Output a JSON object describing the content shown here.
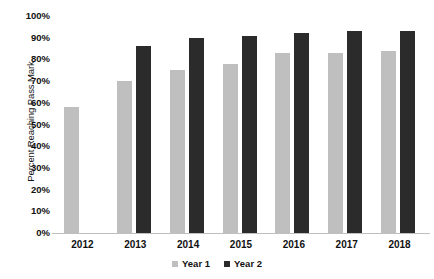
{
  "chart_data": {
    "type": "bar",
    "title": "",
    "xlabel": "",
    "ylabel": "Percent Reaching Pass Mark",
    "ylim": [
      0,
      100
    ],
    "ytick_labels": [
      "100%",
      "90%",
      "80%",
      "70%",
      "60%",
      "50%",
      "40%",
      "30%",
      "20%",
      "10%",
      "0%"
    ],
    "ytick_values": [
      100,
      90,
      80,
      70,
      60,
      50,
      40,
      30,
      20,
      10,
      0
    ],
    "grid": false,
    "legend_position": "bottom",
    "categories": [
      "2012",
      "2013",
      "2014",
      "2015",
      "2016",
      "2017",
      "2018"
    ],
    "series": [
      {
        "name": "Year 1",
        "color": "#bfbfbf",
        "values": [
          58,
          70,
          75,
          78,
          83,
          83,
          84
        ]
      },
      {
        "name": "Year 2",
        "color": "#2b2b2b",
        "values": [
          null,
          86,
          90,
          91,
          92,
          93,
          93
        ]
      }
    ]
  }
}
